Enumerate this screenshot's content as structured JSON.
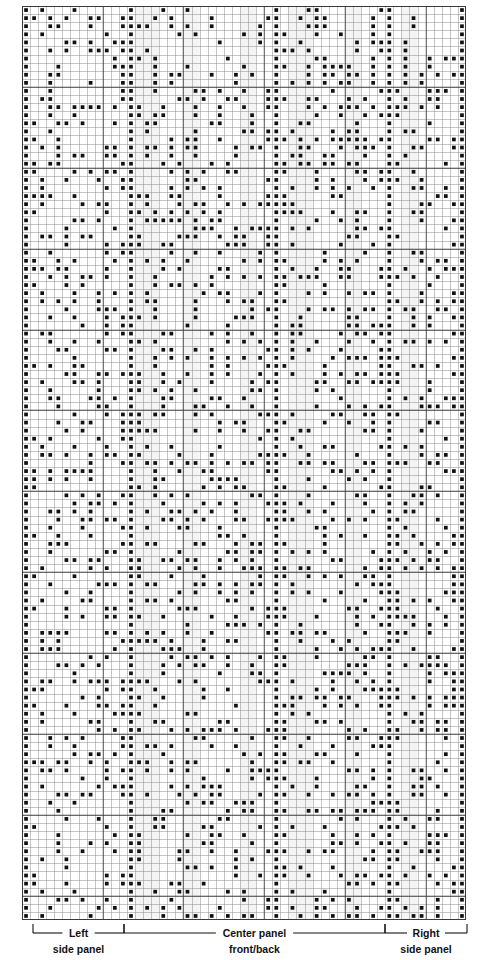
{
  "chart_data": {
    "type": "heatmap",
    "title": "",
    "xlabel": "",
    "ylabel": "",
    "grid": {
      "columns": 55,
      "rows": 113,
      "cell_px": 8.07,
      "major_gridline_every": 10,
      "grid_left_px": 22,
      "grid_top_px": 6,
      "grid_width_px": 444,
      "grid_height_px": 914
    },
    "colors": {
      "filled_cell": "#111111",
      "minor_gridline": "#8c8c8c",
      "major_gridline": "#3a3a3a",
      "shaded_band": "#ebebeb",
      "background": "#ffffff",
      "bracket": "#111111"
    },
    "legend_position": "bottom",
    "panels": [
      {
        "name": "left-side-panel",
        "line1": "Left",
        "line2": "side panel",
        "start_col": 1,
        "end_col": 13
      },
      {
        "name": "center-panel",
        "line1": "Center panel",
        "line2": "front/back",
        "start_col": 13,
        "end_col": 45
      },
      {
        "name": "right-side-panel",
        "line1": "Right",
        "line2": "side panel",
        "start_col": 45,
        "end_col": 55
      }
    ],
    "seed": 20240617,
    "density": 0.27
  },
  "legend": {
    "brackets": [
      {
        "id": "left",
        "line1": "Left",
        "line2": "side panel",
        "x1": 33,
        "x2": 124
      },
      {
        "id": "center",
        "line1": "Center panel",
        "line2": "front/back",
        "x1": 124,
        "x2": 385
      },
      {
        "id": "right",
        "line1": "Right",
        "line2": "side panel",
        "x1": 385,
        "x2": 467
      }
    ]
  },
  "top_crop": {
    "text": ""
  }
}
